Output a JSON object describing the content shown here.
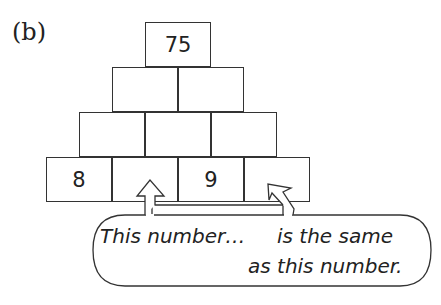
{
  "label": "(b)",
  "pyramid": {
    "rows": [
      [
        "75"
      ],
      [
        "",
        ""
      ],
      [
        "",
        "",
        ""
      ],
      [
        "8",
        "",
        "9",
        ""
      ]
    ]
  },
  "callout": {
    "line1_left": "This number…",
    "line1_right": "is the same",
    "line2": "as this number.",
    "arrow_from": "row4-col2",
    "arrow_to": "row4-col4"
  }
}
